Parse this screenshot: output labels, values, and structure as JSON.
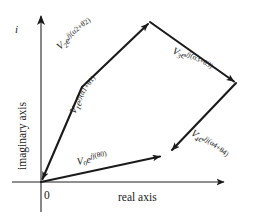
{
  "figure": {
    "background_color": "#ffffff",
    "stroke_color": "#1a1a1a",
    "axes": {
      "imaginary_axis_label": "imaginary axis",
      "real_axis_label": "real axis",
      "imaginary_unit_label": "i",
      "origin_label": "0"
    },
    "vectors": [
      {
        "id": "v0",
        "label_base": "V",
        "label_sub": "0",
        "label_exp": "j(θ0)",
        "label_full": "V₀e^{j(θ0)}",
        "from": [
          41,
          182
        ],
        "to": [
          163,
          156
        ],
        "arrowhead": "at-tip"
      },
      {
        "id": "v1",
        "label_base": "V",
        "label_sub": "1",
        "label_exp": "j(α1+θ1)",
        "label_full": "V₁e^{j(α1+θ1)}",
        "from": [
          82,
          87
        ],
        "to": [
          41,
          182
        ],
        "arrowhead": "at-origin"
      },
      {
        "id": "v2",
        "label_base": "V",
        "label_sub": "2",
        "label_exp": "j(α2+θ2)",
        "label_full": "V₂e^{j(α2+θ2)}",
        "from": [
          82,
          87
        ],
        "to": [
          150,
          22
        ],
        "arrowhead": "at-tip"
      },
      {
        "id": "v3",
        "label_base": "V",
        "label_sub": "3",
        "label_exp": "j(α3+θ3)",
        "label_full": "V₃e^{j(α3+θ3)}",
        "from": [
          150,
          22
        ],
        "to": [
          236,
          83
        ],
        "arrowhead": "at-tip"
      },
      {
        "id": "v4",
        "label_base": "V",
        "label_sub": "4",
        "label_exp": "j(α4+θ4)",
        "label_full": "V₄e^{j(α4+θ4)}",
        "from": [
          236,
          83
        ],
        "to": [
          170,
          152
        ],
        "arrowhead": "at-tip"
      }
    ],
    "exp_symbol": "e",
    "imag_unit_exp": "j"
  }
}
